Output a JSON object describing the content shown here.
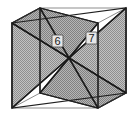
{
  "figure": {
    "name": "cube-with-two-intersecting-diagonal-planes",
    "title": "",
    "background_color": "#ffffff",
    "line_color": "#555555",
    "edge_color": "#1a1a1a",
    "plane_fill_color": "#b4b4b4",
    "plane_hatch_color": "#8a8a8a",
    "label_text_color": "#1a1a1a",
    "label_box_fill": "#e8e8e8",
    "width": 139,
    "height": 117
  },
  "labels": [
    {
      "id": "plane-6",
      "text": "6",
      "x": 57,
      "y": 44
    },
    {
      "id": "plane-7",
      "text": "7",
      "x": 91,
      "y": 41
    }
  ],
  "geometry": {
    "front_face": {
      "left": 12,
      "right": 98,
      "top": 23,
      "bottom": 108
    },
    "depth_offset": {
      "dx": 28,
      "dy": -15
    },
    "vertices": {
      "front_top_left": "12,23",
      "front_top_right": "98,23",
      "front_bottom_left": "12,108",
      "front_bottom_right": "98,108",
      "back_top_left": "40,8",
      "back_top_right": "126,8",
      "back_bottom_left": "40,93",
      "back_bottom_right": "126,93"
    },
    "plane_6_polygon": "40,8 98,23 98,108 40,93",
    "plane_7_polygon": "12,23 126,8 126,93 12,108"
  }
}
